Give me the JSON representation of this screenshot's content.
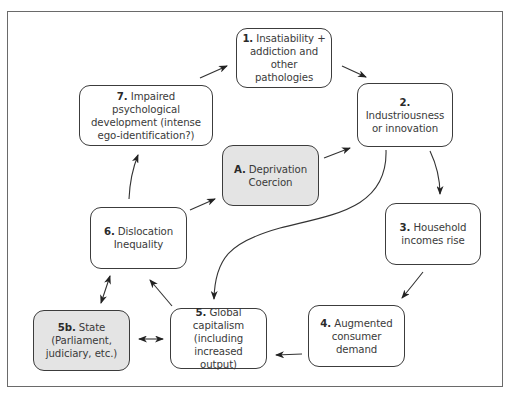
{
  "diagram": {
    "type": "cycle-flow",
    "colors": {
      "border": "#3c3c3c",
      "gray_fill": "#e4e4e4",
      "text": "#3a3a3a",
      "frame": "#6a6a6a"
    },
    "nodes": [
      {
        "id": "1",
        "num": "1.",
        "lines": [
          "Insatiability +",
          "addiction and",
          "other pathologies"
        ],
        "shaded": false
      },
      {
        "id": "2",
        "num": "2.",
        "lines": [
          "Industriousness",
          "or innovation"
        ],
        "shaded": false
      },
      {
        "id": "3",
        "num": "3.",
        "lines": [
          "Household",
          "incomes rise"
        ],
        "shaded": false
      },
      {
        "id": "4",
        "num": "4.",
        "lines": [
          "Augmented",
          "consumer",
          "demand"
        ],
        "shaded": false
      },
      {
        "id": "5",
        "num": "5.",
        "lines": [
          "Global",
          "capitalism",
          "(including",
          "increased output)"
        ],
        "shaded": false
      },
      {
        "id": "5b",
        "num": "5b.",
        "lines": [
          "State",
          "(Parliament,",
          "judiciary, etc.)"
        ],
        "shaded": true
      },
      {
        "id": "6",
        "num": "6.",
        "lines": [
          "Dislocation",
          "Inequality"
        ],
        "shaded": false
      },
      {
        "id": "7",
        "num": "7.",
        "lines": [
          "Impaired psychological",
          "development (intense",
          "ego-identification?)"
        ],
        "shaded": false
      },
      {
        "id": "A",
        "num": "A.",
        "lines": [
          "Deprivation",
          "Coercion"
        ],
        "shaded": true
      }
    ],
    "edges": [
      {
        "from": "7",
        "to": "1"
      },
      {
        "from": "1",
        "to": "2"
      },
      {
        "from": "2",
        "to": "3"
      },
      {
        "from": "2",
        "to": "5",
        "style": "curved"
      },
      {
        "from": "3",
        "to": "4"
      },
      {
        "from": "4",
        "to": "5"
      },
      {
        "from": "5",
        "to": "6"
      },
      {
        "from": "5",
        "to": "5b",
        "bidirectional": true
      },
      {
        "from": "6",
        "to": "5b",
        "bidirectional": true
      },
      {
        "from": "6",
        "to": "7"
      },
      {
        "from": "6",
        "to": "A"
      },
      {
        "from": "A",
        "to": "2"
      }
    ]
  }
}
